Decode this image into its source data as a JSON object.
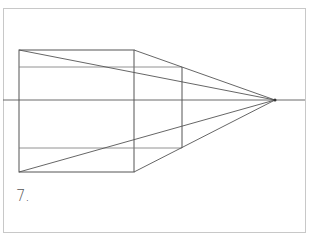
{
  "figure": {
    "label": "7.",
    "frame": {
      "x": 3,
      "y": 8,
      "width": 302,
      "height": 224,
      "color": "#c8c8c8"
    },
    "horizon": {
      "y": 100,
      "x1": 3,
      "x2": 305,
      "color": "#555555"
    },
    "vanishing_point": {
      "x": 275,
      "y": 100
    },
    "front_face": {
      "x1": 19,
      "y1": 50,
      "x2": 134,
      "y2": 172
    },
    "back_face": {
      "x1": 19,
      "y1": 67,
      "x2": 182,
      "y2": 148
    },
    "line_color": "#555555"
  }
}
